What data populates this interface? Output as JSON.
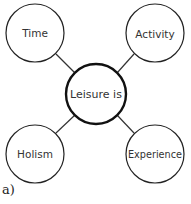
{
  "diagram": {
    "center": {
      "label": "Leisure is",
      "cx": 96,
      "cy": 94,
      "r": 30
    },
    "nodes": [
      {
        "label": "Time",
        "cx": 35,
        "cy": 33,
        "r": 29
      },
      {
        "label": "Activity",
        "cx": 155,
        "cy": 33,
        "r": 29
      },
      {
        "label": "Holism",
        "cx": 35,
        "cy": 154,
        "r": 29
      },
      {
        "label": "Experience",
        "cx": 155,
        "cy": 154,
        "r": 29
      }
    ],
    "caption": "a)"
  }
}
